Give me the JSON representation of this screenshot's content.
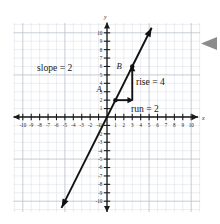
{
  "chart_data": {
    "type": "line",
    "title": "",
    "xlabel": "x",
    "ylabel": "y",
    "xlim": [
      -11,
      11
    ],
    "ylim": [
      -11,
      11
    ],
    "grid": true,
    "legend": "none",
    "x_ticks": [
      -10,
      -9,
      -8,
      -7,
      -6,
      -5,
      -4,
      -3,
      -2,
      -1,
      1,
      2,
      3,
      4,
      5,
      6,
      7,
      8,
      9,
      10
    ],
    "y_ticks": [
      -10,
      -9,
      -8,
      -7,
      -6,
      -5,
      -4,
      -3,
      -2,
      -1,
      1,
      2,
      3,
      4,
      5,
      6,
      7,
      8,
      9,
      10
    ],
    "x_tick_labels": [
      "-10",
      "-9",
      "-8",
      "-7",
      "-6",
      "-5",
      "-4",
      "-3",
      "-2",
      "-1",
      "1",
      "2",
      "3",
      "4",
      "5",
      "6",
      "7",
      "8",
      "9",
      "10"
    ],
    "y_tick_labels": [
      "-10",
      "-9",
      "-8",
      "-7",
      "-6",
      "-5",
      "-4",
      "-3",
      "-2",
      "-1",
      "1",
      "2",
      "3",
      "4",
      "5",
      "6",
      "7",
      "8",
      "9",
      "10"
    ],
    "series": [
      {
        "name": "line",
        "slope": 2,
        "intercept": 0,
        "equation": "y = 2x",
        "x": [
          -5.4,
          5.3
        ],
        "values": [
          -10.8,
          10.6
        ],
        "arrow_both_ends": true
      }
    ],
    "points": [
      {
        "label": "A",
        "x": 1,
        "y": 2
      },
      {
        "label": "B",
        "x": 3,
        "y": 6
      }
    ],
    "annotations": [
      {
        "name": "slope",
        "text": "slope = 2",
        "x": -7.2,
        "y": 5.7
      },
      {
        "name": "rise",
        "text": "rise = 4",
        "x": 3.6,
        "y": 4.2
      },
      {
        "name": "run",
        "text": "run = 2",
        "x": 3.6,
        "y": 1.1
      }
    ],
    "rise_run": {
      "rise": 4,
      "run": 2,
      "from": {
        "x": 1,
        "y": 2
      },
      "corner": {
        "x": 3,
        "y": 2
      },
      "to": {
        "x": 3,
        "y": 6
      }
    }
  },
  "labels": {
    "slope": "slope = 2",
    "rise": "rise = 4",
    "run": "run = 2",
    "point_a": "A",
    "point_b": "B",
    "x_axis": "x",
    "y_axis": "y"
  },
  "colors": {
    "line": "#111111",
    "axis": "#1a1a1a",
    "grid_minor": "#d8dde4",
    "grid_major": "#b9c1cb",
    "background": "#ffffff",
    "cursor": "#8c8c8c"
  },
  "cursor": {
    "name": "left-pointing-arrow",
    "glyph": "◀"
  }
}
